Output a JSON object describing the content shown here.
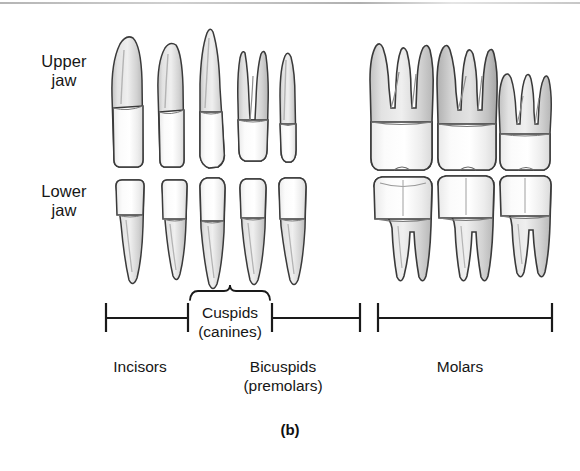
{
  "figure": {
    "caption": "(b)",
    "background_color": "#ffffff",
    "ink_color": "#1a1a1a"
  },
  "rows": {
    "upper": {
      "label": "Upper\njaw"
    },
    "lower": {
      "label": "Lower\njaw"
    }
  },
  "groups": [
    {
      "key": "incisors",
      "label": "Incisors"
    },
    {
      "key": "cuspids",
      "label": "Cuspids\n(canines)"
    },
    {
      "key": "bicuspids",
      "label": "Bicuspids\n(premolars)"
    },
    {
      "key": "molars",
      "label": "Molars"
    }
  ],
  "teeth": {
    "upper": [
      {
        "name": "central-incisor",
        "group": "incisors",
        "roots": 1
      },
      {
        "name": "lateral-incisor",
        "group": "incisors",
        "roots": 1
      },
      {
        "name": "canine",
        "group": "cuspids",
        "roots": 1
      },
      {
        "name": "first-premolar",
        "group": "bicuspids",
        "roots": 2
      },
      {
        "name": "second-premolar",
        "group": "bicuspids",
        "roots": 1
      },
      {
        "name": "first-molar",
        "group": "molars",
        "roots": 3
      },
      {
        "name": "second-molar",
        "group": "molars",
        "roots": 3
      },
      {
        "name": "third-molar",
        "group": "molars",
        "roots": 3
      }
    ],
    "lower": [
      {
        "name": "central-incisor",
        "group": "incisors",
        "roots": 1
      },
      {
        "name": "lateral-incisor",
        "group": "incisors",
        "roots": 1
      },
      {
        "name": "canine",
        "group": "cuspids",
        "roots": 1
      },
      {
        "name": "first-premolar",
        "group": "bicuspids",
        "roots": 1
      },
      {
        "name": "second-premolar",
        "group": "bicuspids",
        "roots": 1
      },
      {
        "name": "first-molar",
        "group": "molars",
        "roots": 2
      },
      {
        "name": "second-molar",
        "group": "molars",
        "roots": 2
      },
      {
        "name": "third-molar",
        "group": "molars",
        "roots": 2
      }
    ]
  }
}
